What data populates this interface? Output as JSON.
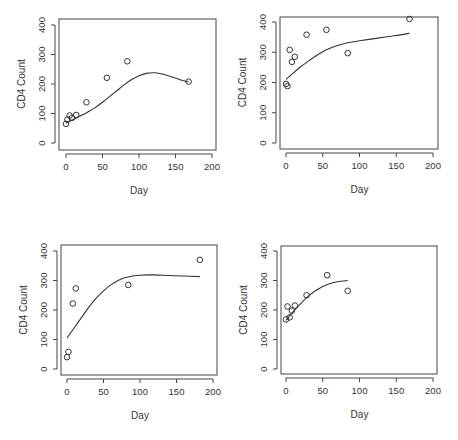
{
  "figure": {
    "layout": "2x2 grid of scatter plots with smooth fitted curves"
  },
  "chart_data": [
    {
      "type": "scatter",
      "panel": "top-left",
      "title": "",
      "xlabel": "Day",
      "ylabel": "CD4 Count",
      "xlim": [
        0,
        200
      ],
      "ylim": [
        0,
        400
      ],
      "xticks": [
        0,
        50,
        100,
        150,
        200
      ],
      "yticks": [
        0,
        100,
        200,
        300,
        400
      ],
      "grid": false,
      "points": {
        "x": [
          0,
          2,
          5,
          8,
          14,
          28,
          56,
          84,
          168
        ],
        "y": [
          65,
          80,
          93,
          85,
          95,
          138,
          221,
          277,
          208
        ]
      },
      "fit_curve": {
        "x": [
          0,
          10,
          20,
          30,
          40,
          50,
          60,
          70,
          80,
          90,
          100,
          110,
          120,
          130,
          140,
          150,
          160,
          168
        ],
        "y": [
          68,
          80,
          92,
          105,
          120,
          138,
          158,
          178,
          198,
          215,
          228,
          236,
          238,
          235,
          228,
          220,
          212,
          207
        ]
      }
    },
    {
      "type": "scatter",
      "panel": "top-right",
      "title": "",
      "xlabel": "Day",
      "ylabel": "CD4 Count",
      "xlim": [
        0,
        200
      ],
      "ylim": [
        0,
        400
      ],
      "xticks": [
        0,
        50,
        100,
        150,
        200
      ],
      "yticks": [
        0,
        100,
        200,
        300,
        400
      ],
      "grid": false,
      "points": {
        "x": [
          0,
          2,
          5,
          8,
          12,
          28,
          55,
          84,
          168
        ],
        "y": [
          195,
          188,
          308,
          268,
          285,
          358,
          374,
          297,
          410
        ]
      },
      "fit_curve": {
        "x": [
          0,
          10,
          20,
          30,
          40,
          50,
          60,
          70,
          80,
          90,
          100,
          120,
          140,
          160,
          168
        ],
        "y": [
          210,
          232,
          252,
          270,
          287,
          302,
          313,
          322,
          329,
          334,
          338,
          345,
          352,
          359,
          363
        ]
      }
    },
    {
      "type": "scatter",
      "panel": "bottom-left",
      "title": "",
      "xlabel": "Day",
      "ylabel": "CD4 Count",
      "xlim": [
        0,
        200
      ],
      "ylim": [
        0,
        400
      ],
      "xticks": [
        0,
        50,
        100,
        150,
        200
      ],
      "yticks": [
        0,
        100,
        200,
        300,
        400
      ],
      "grid": false,
      "points": {
        "x": [
          0,
          2,
          8,
          12,
          84,
          182
        ],
        "y": [
          40,
          58,
          222,
          273,
          285,
          370
        ]
      },
      "fit_curve": {
        "x": [
          0,
          10,
          20,
          30,
          40,
          50,
          60,
          70,
          80,
          90,
          100,
          110,
          120,
          140,
          160,
          182
        ],
        "y": [
          105,
          140,
          175,
          210,
          240,
          265,
          285,
          300,
          310,
          315,
          318,
          319,
          319,
          317,
          315,
          313
        ]
      }
    },
    {
      "type": "scatter",
      "panel": "bottom-right",
      "title": "",
      "xlabel": "Day",
      "ylabel": "CD4 Count",
      "xlim": [
        0,
        200
      ],
      "ylim": [
        0,
        400
      ],
      "xticks": [
        0,
        50,
        100,
        150,
        200
      ],
      "yticks": [
        0,
        100,
        200,
        300,
        400
      ],
      "grid": false,
      "points": {
        "x": [
          0,
          2,
          5,
          8,
          12,
          28,
          56,
          84
        ],
        "y": [
          168,
          212,
          175,
          198,
          215,
          250,
          318,
          265
        ]
      },
      "fit_curve": {
        "x": [
          0,
          10,
          20,
          30,
          40,
          50,
          60,
          70,
          84
        ],
        "y": [
          165,
          195,
          222,
          246,
          265,
          280,
          290,
          296,
          300
        ]
      }
    }
  ]
}
